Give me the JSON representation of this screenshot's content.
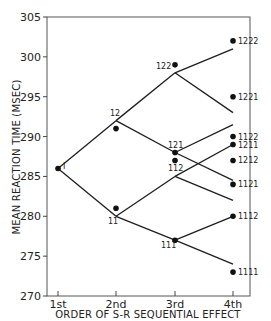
{
  "chart_data": {
    "type": "line",
    "title": "",
    "xlabel": "ORDER OF S-R SEQUENTIAL EFFECT",
    "ylabel": "MEAN REACTION TIME (MSEC)",
    "ylim": [
      270,
      305
    ],
    "yticks": [
      270,
      275,
      280,
      285,
      290,
      295,
      300,
      305
    ],
    "categories": [
      "1st",
      "2nd",
      "3rd",
      "4th"
    ],
    "grid": false,
    "legend": null,
    "tree_lines": [
      {
        "from": "I",
        "to": "12",
        "path": [
          [
            1,
            286.0
          ],
          [
            2,
            292.0
          ]
        ]
      },
      {
        "from": "I",
        "to": "11",
        "path": [
          [
            1,
            286.0
          ],
          [
            2,
            280.0
          ]
        ]
      },
      {
        "from": "12",
        "to": "122",
        "path": [
          [
            2,
            292.0
          ],
          [
            3,
            298.0
          ]
        ]
      },
      {
        "from": "12",
        "to": "121",
        "path": [
          [
            2,
            292.0
          ],
          [
            3,
            288.0
          ]
        ]
      },
      {
        "from": "11",
        "to": "112",
        "path": [
          [
            2,
            280.0
          ],
          [
            3,
            285.0
          ]
        ]
      },
      {
        "from": "11",
        "to": "111",
        "path": [
          [
            2,
            280.0
          ],
          [
            3,
            277.0
          ]
        ]
      },
      {
        "from": "122",
        "to": "1222",
        "path": [
          [
            3,
            298.0
          ],
          [
            4,
            301.0
          ]
        ]
      },
      {
        "from": "122",
        "to": "1221",
        "path": [
          [
            3,
            298.0
          ],
          [
            4,
            293.0
          ]
        ]
      },
      {
        "from": "121",
        "to": "1212",
        "path": [
          [
            3,
            288.0
          ],
          [
            4,
            291.5
          ]
        ]
      },
      {
        "from": "121",
        "to": "1211",
        "path": [
          [
            3,
            288.0
          ],
          [
            4,
            284.5
          ]
        ]
      },
      {
        "from": "112",
        "to": "1122",
        "path": [
          [
            3,
            285.0
          ],
          [
            4,
            289.0
          ]
        ]
      },
      {
        "from": "112",
        "to": "1121",
        "path": [
          [
            3,
            285.0
          ],
          [
            4,
            282.0
          ]
        ]
      },
      {
        "from": "111",
        "to": "1112",
        "path": [
          [
            3,
            277.0
          ],
          [
            4,
            280.0
          ]
        ]
      },
      {
        "from": "111",
        "to": "1111",
        "path": [
          [
            3,
            277.0
          ],
          [
            4,
            274.0
          ]
        ]
      }
    ],
    "observed_points": [
      {
        "label": "I",
        "x": 1,
        "y": 286.0
      },
      {
        "label": "12",
        "x": 2,
        "y": 291.0
      },
      {
        "label": "11",
        "x": 2,
        "y": 281.0
      },
      {
        "label": "122",
        "x": 3,
        "y": 299.0
      },
      {
        "label": "121",
        "x": 3,
        "y": 288.0
      },
      {
        "label": "112",
        "x": 3,
        "y": 287.0
      },
      {
        "label": "111",
        "x": 3,
        "y": 277.0
      },
      {
        "label": "1222",
        "x": 4,
        "y": 302.0
      },
      {
        "label": "1221",
        "x": 4,
        "y": 295.0
      },
      {
        "label": "1122",
        "x": 4,
        "y": 290.0
      },
      {
        "label": "1211",
        "x": 4,
        "y": 289.0
      },
      {
        "label": "1212",
        "x": 4,
        "y": 287.0
      },
      {
        "label": "1121",
        "x": 4,
        "y": 284.0
      },
      {
        "label": "1112",
        "x": 4,
        "y": 280.0
      },
      {
        "label": "1111",
        "x": 4,
        "y": 273.0
      }
    ],
    "node_labels": [
      {
        "text": "I",
        "x": 1,
        "y": 286.0,
        "dx": 5,
        "dy": 1
      },
      {
        "text": "12",
        "x": 2,
        "y": 292.0,
        "dx": -6,
        "dy": -5
      },
      {
        "text": "11",
        "x": 2,
        "y": 280.0,
        "dx": -8,
        "dy": 8
      },
      {
        "text": "122",
        "x": 3,
        "y": 298.0,
        "dx": -19,
        "dy": -4
      },
      {
        "text": "121",
        "x": 3,
        "y": 288.0,
        "dx": -7,
        "dy": -5
      },
      {
        "text": "112",
        "x": 3,
        "y": 285.0,
        "dx": -7,
        "dy": -5
      },
      {
        "text": "111",
        "x": 3,
        "y": 277.0,
        "dx": -14,
        "dy": 8
      },
      {
        "text": "1222",
        "x": 4,
        "y": 302.0,
        "dx": 5,
        "dy": 3
      },
      {
        "text": "1221",
        "x": 4,
        "y": 295.0,
        "dx": 5,
        "dy": 3
      },
      {
        "text": "1122",
        "x": 4,
        "y": 290.0,
        "dx": 5,
        "dy": 3
      },
      {
        "text": "1211",
        "x": 4,
        "y": 289.0,
        "dx": 5,
        "dy": 3
      },
      {
        "text": "1212",
        "x": 4,
        "y": 287.0,
        "dx": 5,
        "dy": 3
      },
      {
        "text": "1121",
        "x": 4,
        "y": 284.0,
        "dx": 5,
        "dy": 3
      },
      {
        "text": "1112",
        "x": 4,
        "y": 280.0,
        "dx": 5,
        "dy": 3
      },
      {
        "text": "1111",
        "x": 4,
        "y": 273.0,
        "dx": 5,
        "dy": 3
      }
    ]
  }
}
